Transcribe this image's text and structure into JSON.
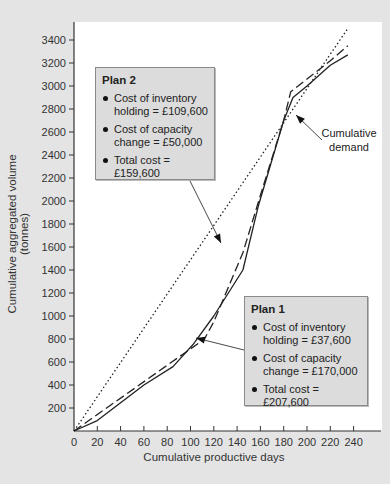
{
  "chart_data": {
    "type": "line",
    "title": "",
    "xlabel": "Cumulative productive days",
    "ylabel": "Cumulative aggregated volume (tonnes)",
    "xlim": [
      0,
      240
    ],
    "ylim": [
      0,
      3400
    ],
    "xticks": [
      0,
      20,
      40,
      60,
      80,
      100,
      120,
      140,
      160,
      180,
      200,
      220,
      240
    ],
    "yticks": [
      200,
      400,
      600,
      800,
      1000,
      1200,
      1400,
      1600,
      1800,
      2000,
      2200,
      2400,
      2600,
      2800,
      3000,
      3200,
      3400
    ],
    "grid": false,
    "legend": "annotations",
    "series": [
      {
        "name": "Cumulative demand",
        "style": "solid",
        "points": [
          [
            0,
            0
          ],
          [
            20,
            90
          ],
          [
            60,
            400
          ],
          [
            85,
            560
          ],
          [
            102,
            750
          ],
          [
            120,
            1000
          ],
          [
            145,
            1400
          ],
          [
            158,
            1950
          ],
          [
            180,
            2700
          ],
          [
            188,
            2900
          ],
          [
            200,
            3000
          ],
          [
            220,
            3180
          ],
          [
            235,
            3270
          ]
        ]
      },
      {
        "name": "Plan 1",
        "style": "dashed",
        "points": [
          [
            0,
            0
          ],
          [
            112,
            800
          ],
          [
            120,
            950
          ],
          [
            145,
            1550
          ],
          [
            160,
            2050
          ],
          [
            180,
            2700
          ],
          [
            186,
            2950
          ],
          [
            200,
            3060
          ],
          [
            220,
            3220
          ],
          [
            235,
            3350
          ]
        ]
      },
      {
        "name": "Plan 2",
        "style": "dotted",
        "points": [
          [
            0,
            0
          ],
          [
            235,
            3500
          ]
        ]
      }
    ],
    "annotations": [
      {
        "title": "Plan 2",
        "items": [
          "Cost of inventory holding = £109,600",
          "Cost of capacity change = £50,000",
          "Total cost = £159,600"
        ]
      },
      {
        "title": "Plan 1",
        "items": [
          "Cost of inventory holding = £37,600",
          "Cost of capacity change = £170,000",
          "Total cost = £207,600"
        ]
      },
      {
        "text": "Cumulative demand"
      }
    ]
  },
  "labels": {
    "xlabel": "Cumulative productive days",
    "ylabel": "Cumulative aggregated volume (tonnes)",
    "demand": "Cumulative demand"
  },
  "plan2": {
    "title": "Plan 2",
    "item1": "Cost of inventory holding = £109,600",
    "item2": "Cost of capacity change = £50,000",
    "item3": "Total cost = £159,600"
  },
  "plan1": {
    "title": "Plan 1",
    "item1": "Cost of inventory holding = £37,600",
    "item2": "Cost of capacity change = £170,000",
    "item3": "Total cost = £207,600"
  },
  "colors": {
    "background": "#e4e4e4",
    "plot": "#ffffff",
    "callout": "#dcdcdc",
    "line": "#222222"
  }
}
